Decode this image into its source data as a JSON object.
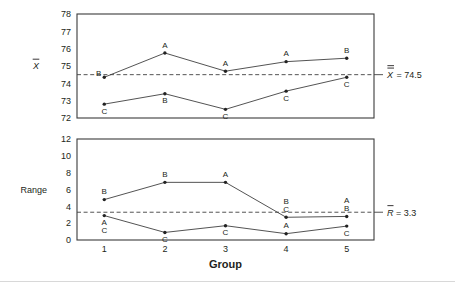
{
  "figure": {
    "width": 455,
    "height": 284,
    "background_color": "#ffffff",
    "line_color": "#404040",
    "text_color": "#231f20",
    "x_axis_title": "Group",
    "x_tick_labels": [
      "1",
      "2",
      "3",
      "4",
      "5"
    ]
  },
  "chart_data": [
    {
      "type": "line",
      "title": "",
      "panel": "xbar-chart",
      "xlabel": "Group",
      "ylabel": "X̄",
      "ylabel_plain": "Xbar",
      "x": [
        1,
        2,
        3,
        4,
        5
      ],
      "xlim": [
        0.55,
        5.45
      ],
      "ylim": [
        72,
        78
      ],
      "yticks": [
        72,
        73,
        74,
        75,
        76,
        77,
        78
      ],
      "ytick_labels": [
        "72",
        "73",
        "74",
        "75",
        "76",
        "77",
        "78"
      ],
      "xtick_labels": [
        "1",
        "2",
        "3",
        "4",
        "5"
      ],
      "grid": false,
      "legend": "none",
      "series": [
        {
          "name": "upper",
          "values": [
            74.35,
            75.75,
            74.7,
            75.25,
            75.45
          ],
          "point_labels": [
            "B",
            "A",
            "A",
            "A",
            "B"
          ],
          "label_positions": [
            "left",
            "above",
            "above",
            "above",
            "above"
          ]
        },
        {
          "name": "lower",
          "values": [
            72.8,
            73.4,
            72.5,
            73.55,
            74.35
          ],
          "point_labels": [
            "C",
            "B",
            "C",
            "C",
            "C"
          ],
          "label_positions": [
            "below",
            "below",
            "below",
            "below",
            "below"
          ]
        }
      ],
      "center_line": {
        "value": 74.5,
        "style": "dashed",
        "label": "X̶̶ = 74.5",
        "label_symbol": "X",
        "label_text": "= 74.5",
        "label_value": "74.5"
      }
    },
    {
      "type": "line",
      "title": "",
      "panel": "range-chart",
      "xlabel": "Group",
      "ylabel": "Range",
      "x": [
        1,
        2,
        3,
        4,
        5
      ],
      "xlim": [
        0.55,
        5.45
      ],
      "ylim": [
        0,
        12
      ],
      "yticks": [
        0,
        2,
        4,
        6,
        8,
        10,
        12
      ],
      "ytick_labels": [
        "0",
        "2",
        "4",
        "6",
        "8",
        "10",
        "12"
      ],
      "xtick_labels": [
        "1",
        "2",
        "3",
        "4",
        "5"
      ],
      "grid": false,
      "legend": "none",
      "series": [
        {
          "name": "upper",
          "values": [
            4.8,
            6.85,
            6.85,
            2.7,
            2.8
          ],
          "point_labels": [
            "B",
            "B",
            "A",
            "B,C",
            "A,B"
          ],
          "label_positions": [
            "above",
            "above",
            "above",
            "above",
            "above"
          ]
        },
        {
          "name": "lower",
          "values": [
            2.9,
            0.9,
            1.7,
            0.75,
            1.65
          ],
          "point_labels": [
            "A,C",
            "C",
            "C",
            "A",
            "C"
          ],
          "label_positions": [
            "below",
            "below",
            "below",
            "above",
            "below"
          ]
        }
      ],
      "center_line": {
        "value": 3.3,
        "style": "dashed",
        "label": "R̄ = 3.3",
        "label_symbol": "R",
        "label_text": "= 3.3",
        "label_value": "3.3"
      }
    }
  ],
  "annotations": {
    "xbar_axis_label": "X",
    "range_axis_label": "Range",
    "xbar_center_symbol": "X",
    "xbar_center_equals": "= 74.5",
    "range_center_symbol": "R",
    "range_center_equals": "= 3.3",
    "group_title": "Group"
  }
}
